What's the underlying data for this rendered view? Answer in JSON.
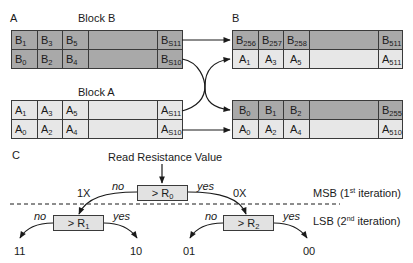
{
  "panels": {
    "a": {
      "label": "A",
      "block_b": {
        "title": "Block B",
        "rows": [
          [
            {
              "base": "B",
              "sub": "1"
            },
            {
              "base": "B",
              "sub": "3"
            },
            {
              "base": "B",
              "sub": "5"
            },
            {
              "base": "",
              "sub": ""
            },
            {
              "base": "B",
              "sub": "S11"
            }
          ],
          [
            {
              "base": "B",
              "sub": "0"
            },
            {
              "base": "B",
              "sub": "2"
            },
            {
              "base": "B",
              "sub": "4"
            },
            {
              "base": "",
              "sub": ""
            },
            {
              "base": "B",
              "sub": "S10"
            }
          ]
        ]
      },
      "block_a": {
        "title": "Block A",
        "rows": [
          [
            {
              "base": "A",
              "sub": "1"
            },
            {
              "base": "A",
              "sub": "3"
            },
            {
              "base": "A",
              "sub": "5"
            },
            {
              "base": "",
              "sub": ""
            },
            {
              "base": "A",
              "sub": "S11"
            }
          ],
          [
            {
              "base": "A",
              "sub": "0"
            },
            {
              "base": "A",
              "sub": "2"
            },
            {
              "base": "A",
              "sub": "4"
            },
            {
              "base": "",
              "sub": ""
            },
            {
              "base": "A",
              "sub": "S10"
            }
          ]
        ]
      }
    },
    "b": {
      "label": "B",
      "top_block": {
        "rows": [
          [
            {
              "base": "B",
              "sub": "256"
            },
            {
              "base": "B",
              "sub": "257"
            },
            {
              "base": "B",
              "sub": "258"
            },
            {
              "base": "",
              "sub": ""
            },
            {
              "base": "B",
              "sub": "511"
            }
          ],
          [
            {
              "base": "A",
              "sub": "1"
            },
            {
              "base": "A",
              "sub": "3"
            },
            {
              "base": "A",
              "sub": "5"
            },
            {
              "base": "",
              "sub": ""
            },
            {
              "base": "A",
              "sub": "511"
            }
          ]
        ]
      },
      "bottom_block": {
        "rows": [
          [
            {
              "base": "B",
              "sub": "0"
            },
            {
              "base": "B",
              "sub": "1"
            },
            {
              "base": "B",
              "sub": "2"
            },
            {
              "base": "",
              "sub": ""
            },
            {
              "base": "B",
              "sub": "255"
            }
          ],
          [
            {
              "base": "A",
              "sub": "0"
            },
            {
              "base": "A",
              "sub": "2"
            },
            {
              "base": "A",
              "sub": "4"
            },
            {
              "base": "",
              "sub": ""
            },
            {
              "base": "A",
              "sub": "510"
            }
          ]
        ]
      }
    },
    "c": {
      "label": "C",
      "input_label": "Read Resistance Value",
      "root": {
        "prefix": "> R",
        "sub": "0"
      },
      "left_node": {
        "prefix": "> R",
        "sub": "1"
      },
      "right_node": {
        "prefix": "> R",
        "sub": "2"
      },
      "root_no": "no",
      "root_yes": "yes",
      "branch_left": "1X",
      "branch_right": "0X",
      "left_no": "no",
      "left_yes": "yes",
      "right_no": "no",
      "right_yes": "yes",
      "outputs": [
        "11",
        "10",
        "01",
        "00"
      ],
      "msb_label": {
        "pre": "MSB (1",
        "sup": "st",
        "post": " iteration)"
      },
      "lsb_label": {
        "pre": "LSB (2",
        "sup": "nd",
        "post": " iteration)"
      }
    }
  },
  "colors": {
    "dark_cell": "#a9a9a9",
    "light_cell": "#e7e7e7",
    "line": "#1a1a1a"
  }
}
